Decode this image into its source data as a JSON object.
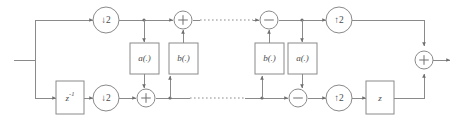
{
  "diagram": {
    "canvas": {
      "width": 457,
      "height": 122
    },
    "colors": {
      "background": "#ffffff",
      "wire": "#8a8a8a",
      "node_stroke": "#8a8a8a",
      "label": "#4a4a4a",
      "arrow": "#6f6f6f"
    },
    "nodes": {
      "downsampler_top": {
        "label": "↓2",
        "arrow": "↓",
        "factor": "2"
      },
      "downsampler_bottom": {
        "label": "↓2",
        "arrow": "↓",
        "factor": "2"
      },
      "upsampler_top": {
        "label": "↑2",
        "arrow": "↑",
        "factor": "2"
      },
      "upsampler_bottom": {
        "label": "↑2",
        "arrow": "↑",
        "factor": "2"
      },
      "delay_input": {
        "label": "z⁻¹",
        "base": "z",
        "exponent": "-1"
      },
      "delay_output": {
        "label": "z",
        "base": "z",
        "exponent": ""
      },
      "lift_a_left": {
        "label": "a(.)"
      },
      "lift_b_left": {
        "label": "b(.)"
      },
      "lift_b_right": {
        "label": "b(.)"
      },
      "lift_a_right": {
        "label": "a(.)"
      },
      "adder_top_left": {
        "label": "+",
        "operation": "add"
      },
      "subtractor_top_right": {
        "label": "−",
        "operation": "subtract"
      },
      "adder_bottom_left": {
        "label": "+",
        "operation": "add"
      },
      "subtractor_bottom_right": {
        "label": "−",
        "operation": "subtract"
      },
      "adder_output": {
        "label": "+",
        "operation": "add"
      }
    },
    "ellipsis": {
      "top": "· · · · · ·",
      "bottom": "· · · · · ·"
    }
  }
}
